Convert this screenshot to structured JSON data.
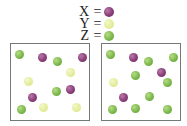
{
  "legend": {
    "items": [
      {
        "label": "X =",
        "species": "X",
        "color": "#8a3c78"
      },
      {
        "label": "Y =",
        "species": "Y",
        "color": "#e2ec98"
      },
      {
        "label": "Z =",
        "species": "Z",
        "color": "#7cb84a"
      }
    ]
  },
  "boxes": [
    {
      "name": "left-container",
      "counts": {
        "X": 4,
        "Y": 4,
        "Z": 4
      },
      "particles": [
        {
          "s": "Z",
          "x": 19,
          "y": 54
        },
        {
          "s": "X",
          "x": 42,
          "y": 57
        },
        {
          "s": "Z",
          "x": 57,
          "y": 61
        },
        {
          "s": "X",
          "x": 82,
          "y": 57
        },
        {
          "s": "Y",
          "x": 70,
          "y": 72
        },
        {
          "s": "Y",
          "x": 28,
          "y": 81
        },
        {
          "s": "Z",
          "x": 56,
          "y": 91
        },
        {
          "s": "X",
          "x": 70,
          "y": 89
        },
        {
          "s": "X",
          "x": 32,
          "y": 97
        },
        {
          "s": "Z",
          "x": 21,
          "y": 109
        },
        {
          "s": "Y",
          "x": 43,
          "y": 107
        },
        {
          "s": "Y",
          "x": 76,
          "y": 107
        }
      ]
    },
    {
      "name": "right-container",
      "counts": {
        "X": 3,
        "Y": 1,
        "Z": 9
      },
      "particles": [
        {
          "s": "Z",
          "x": 110,
          "y": 54
        },
        {
          "s": "X",
          "x": 133,
          "y": 57
        },
        {
          "s": "Z",
          "x": 148,
          "y": 61
        },
        {
          "s": "Z",
          "x": 173,
          "y": 57
        },
        {
          "s": "Z",
          "x": 135,
          "y": 75
        },
        {
          "s": "X",
          "x": 161,
          "y": 72
        },
        {
          "s": "Y",
          "x": 113,
          "y": 82
        },
        {
          "s": "Z",
          "x": 167,
          "y": 82
        },
        {
          "s": "X",
          "x": 123,
          "y": 97
        },
        {
          "s": "Z",
          "x": 149,
          "y": 96
        },
        {
          "s": "Z",
          "x": 112,
          "y": 109
        },
        {
          "s": "Z",
          "x": 135,
          "y": 108
        },
        {
          "s": "Z",
          "x": 167,
          "y": 109
        }
      ]
    }
  ]
}
